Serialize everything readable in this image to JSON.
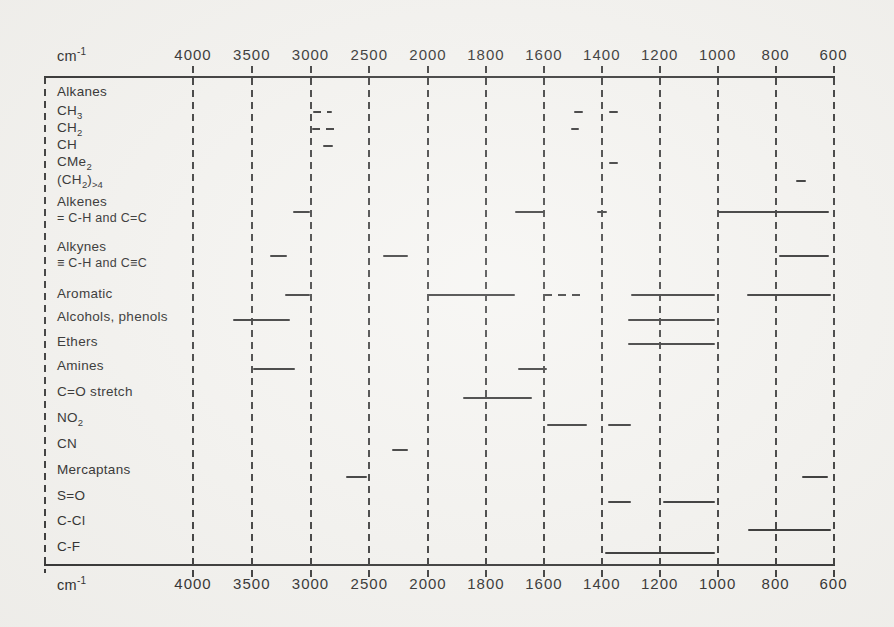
{
  "colors": {
    "ink": "#2a2a2a",
    "paper": "#f5f4f1"
  },
  "axis": {
    "unit_base": "cm",
    "unit_exponent": "-1",
    "ticks": [
      4000,
      3500,
      3000,
      2500,
      2000,
      1800,
      1600,
      1400,
      1200,
      1000,
      800,
      600
    ]
  },
  "chart_data": {
    "type": "bar",
    "subtype": "horizontal-range-correlation-chart",
    "title": "",
    "xlabel": "cm⁻¹",
    "x_axis": {
      "unit": "cm⁻¹",
      "ticks": [
        4000,
        3500,
        3000,
        2500,
        2000,
        1800,
        1600,
        1400,
        1200,
        1000,
        800,
        600
      ],
      "direction": "decreasing left to right",
      "scale": "piecewise linear with scale change at 2000 (4000–2000 compressed, 2000–600 expanded)",
      "range": [
        4000,
        600
      ],
      "tick_labels_top_and_bottom": true,
      "grid": "dashed vertical gridlines at every tick"
    },
    "rows": [
      {
        "id": "alkanes",
        "label": [
          [
            "Alkanes"
          ]
        ],
        "label_y": 92,
        "bar_y": 92,
        "bands": []
      },
      {
        "id": "ch3",
        "label": [
          [
            "CH"
          ],
          [
            "3",
            "sub"
          ]
        ],
        "label_y": 111,
        "bar_y": 112,
        "bands": [
          {
            "from": 2980,
            "to": 2820,
            "style": "dashed"
          },
          {
            "from": 1495,
            "to": 1465
          },
          {
            "from": 1375,
            "to": 1345
          }
        ]
      },
      {
        "id": "ch2",
        "label": [
          [
            "CH"
          ],
          [
            "2",
            "sub"
          ]
        ],
        "label_y": 128,
        "bar_y": 129,
        "bands": [
          {
            "from": 2985,
            "to": 2765,
            "style": "dashed"
          },
          {
            "from": 1505,
            "to": 1480
          }
        ]
      },
      {
        "id": "ch",
        "label": [
          [
            "CH"
          ]
        ],
        "label_y": 145,
        "bar_y": 146,
        "bands": [
          {
            "from": 2895,
            "to": 2810
          }
        ]
      },
      {
        "id": "cme2",
        "label": [
          [
            "CMe"
          ],
          [
            "2",
            "sub"
          ]
        ],
        "label_y": 162,
        "bar_y": 163,
        "bands": [
          {
            "from": 1375,
            "to": 1345
          }
        ]
      },
      {
        "id": "ch2-chain",
        "label": [
          [
            "(CH"
          ],
          [
            "2",
            "sub"
          ],
          [
            ")"
          ],
          [
            ">4",
            "sub"
          ]
        ],
        "label_y": 180,
        "bar_y": 181,
        "bands": [
          {
            "from": 730,
            "to": 695
          }
        ]
      },
      {
        "id": "alkenes",
        "label": [
          [
            "Alkenes"
          ]
        ],
        "sublabel": [
          [
            "= C-H and C=C"
          ]
        ],
        "label_y": 202,
        "sublabel_y": 218,
        "bar_y": 212,
        "bands": [
          {
            "from": 3150,
            "to": 3000
          },
          {
            "from": 1700,
            "to": 1600
          },
          {
            "from": 1415,
            "to": 1380
          },
          {
            "from": 1000,
            "to": 615
          }
        ]
      },
      {
        "id": "alkynes",
        "label": [
          [
            "Alkynes"
          ]
        ],
        "sublabel": [
          [
            "≡ C-H and C≡C"
          ]
        ],
        "label_y": 247,
        "sublabel_y": 263,
        "bar_y": 256,
        "bands": [
          {
            "from": 3345,
            "to": 3200
          },
          {
            "from": 2380,
            "to": 2170
          },
          {
            "from": 790,
            "to": 615
          }
        ]
      },
      {
        "id": "aromatic",
        "label": [
          [
            "Aromatic"
          ]
        ],
        "label_y": 294,
        "bar_y": 295,
        "bands": [
          {
            "from": 3220,
            "to": 3000
          },
          {
            "from": 2000,
            "to": 1700
          },
          {
            "from": 1600,
            "to": 1460,
            "style": "dashed"
          },
          {
            "from": 1300,
            "to": 1010
          },
          {
            "from": 900,
            "to": 610
          }
        ]
      },
      {
        "id": "alcohols-phenols",
        "label": [
          [
            "Alcohols, phenols"
          ]
        ],
        "label_y": 317,
        "bar_y": 320,
        "bands": [
          {
            "from": 3660,
            "to": 3175
          },
          {
            "from": 1310,
            "to": 1010
          }
        ]
      },
      {
        "id": "ethers",
        "label": [
          [
            "Ethers"
          ]
        ],
        "label_y": 342,
        "bar_y": 344,
        "bands": [
          {
            "from": 1310,
            "to": 1010
          }
        ]
      },
      {
        "id": "amines",
        "label": [
          [
            "Amines"
          ]
        ],
        "label_y": 366,
        "bar_y": 369,
        "bands": [
          {
            "from": 3490,
            "to": 3130
          },
          {
            "from": 1690,
            "to": 1590
          }
        ]
      },
      {
        "id": "co-stretch",
        "label": [
          [
            "C=O stretch"
          ]
        ],
        "label_y": 392,
        "bar_y": 398,
        "bands": [
          {
            "from": 1880,
            "to": 1640
          }
        ]
      },
      {
        "id": "no2",
        "label": [
          [
            "NO"
          ],
          [
            "2",
            "sub"
          ]
        ],
        "label_y": 418,
        "bar_y": 425,
        "bands": [
          {
            "from": 1590,
            "to": 1450
          },
          {
            "from": 1380,
            "to": 1300
          }
        ]
      },
      {
        "id": "cn",
        "label": [
          [
            "CN"
          ]
        ],
        "label_y": 444,
        "bar_y": 450,
        "bands": [
          {
            "from": 2310,
            "to": 2170
          }
        ]
      },
      {
        "id": "mercaptans",
        "label": [
          [
            "Mercaptans"
          ]
        ],
        "label_y": 470,
        "bar_y": 477,
        "bands": [
          {
            "from": 2700,
            "to": 2520
          },
          {
            "from": 710,
            "to": 620
          }
        ]
      },
      {
        "id": "s-o",
        "label": [
          [
            "S=O"
          ]
        ],
        "label_y": 496,
        "bar_y": 502,
        "bands": [
          {
            "from": 1380,
            "to": 1300
          },
          {
            "from": 1190,
            "to": 1010
          }
        ]
      },
      {
        "id": "c-cl",
        "label": [
          [
            "C-Cl"
          ]
        ],
        "label_y": 521,
        "bar_y": 530,
        "bands": [
          {
            "from": 895,
            "to": 610
          }
        ]
      },
      {
        "id": "c-f",
        "label": [
          [
            "C-F"
          ]
        ],
        "label_y": 547,
        "bar_y": 553,
        "bands": [
          {
            "from": 1390,
            "to": 1010
          }
        ]
      }
    ]
  }
}
